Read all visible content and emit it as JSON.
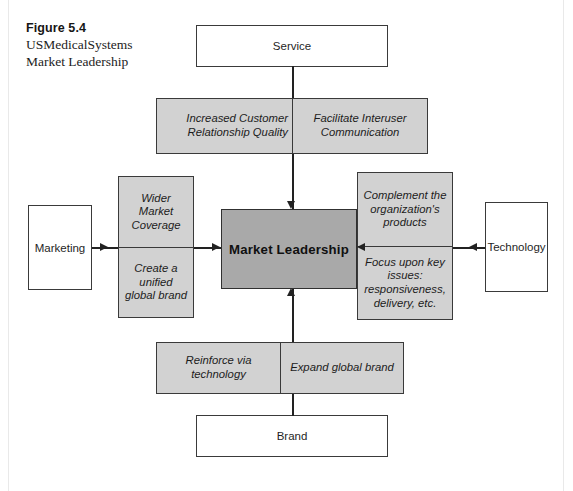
{
  "figure": {
    "caption_title": "Figure 5.4",
    "caption_line1": "USMedicalSystems",
    "caption_line2": "Market Leadership",
    "colors": {
      "panel_fill": "#d2d2d2",
      "center_fill": "#a9a9a9",
      "box_fill": "#ffffff",
      "stroke": "#3a3a3a",
      "text": "#1c1c1c"
    }
  },
  "center": {
    "label": "Market Leadership"
  },
  "drivers": {
    "top": {
      "label": "Service"
    },
    "left": {
      "label": "Marketing"
    },
    "right": {
      "label": "Technology"
    },
    "bottom": {
      "label": "Brand"
    }
  },
  "panels": {
    "top": {
      "orientation": "horizontal",
      "cells": [
        {
          "text": "Increased Customer Relationship Quality"
        },
        {
          "text": "Facilitate Interuser Communication"
        }
      ]
    },
    "left": {
      "orientation": "vertical",
      "cells": [
        {
          "text": "Wider Market Coverage"
        },
        {
          "text": "Create a unified global brand"
        }
      ]
    },
    "right": {
      "orientation": "vertical",
      "cells": [
        {
          "text": "Complement the organization's products"
        },
        {
          "text": "Focus upon key issues: responsiveness, delivery, etc."
        }
      ]
    },
    "bottom": {
      "orientation": "horizontal",
      "cells": [
        {
          "text": "Reinforce via technology"
        },
        {
          "text": "Expand global brand"
        }
      ]
    }
  }
}
